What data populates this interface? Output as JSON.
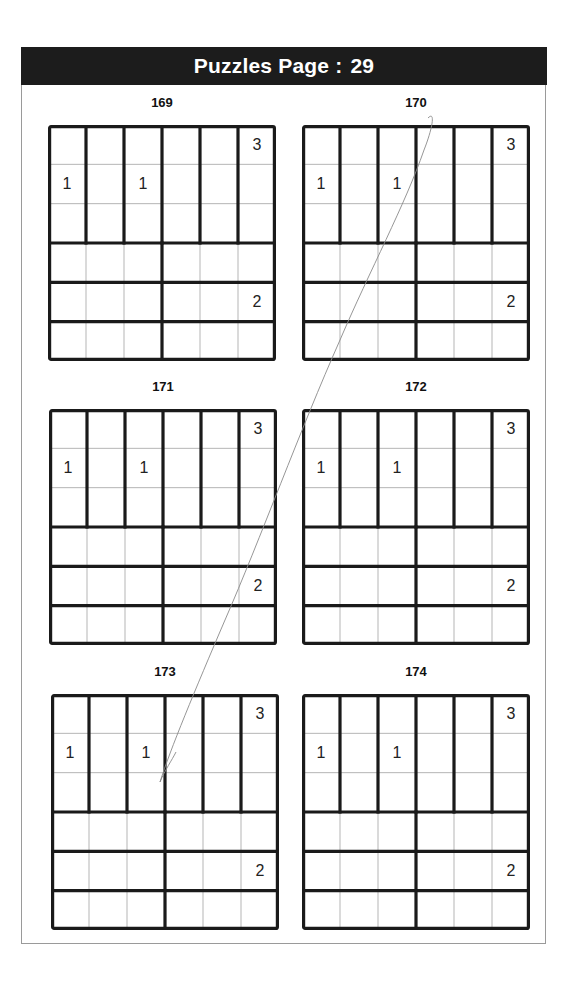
{
  "header": {
    "title": "Puzzles Page :",
    "page_number": "29"
  },
  "grid_size": 6,
  "puzzles": [
    {
      "id": "169",
      "clues": [
        {
          "row": 0,
          "col": 5,
          "value": "3"
        },
        {
          "row": 1,
          "col": 0,
          "value": "1"
        },
        {
          "row": 1,
          "col": 2,
          "value": "1"
        },
        {
          "row": 4,
          "col": 5,
          "value": "2"
        }
      ]
    },
    {
      "id": "170",
      "clues": [
        {
          "row": 0,
          "col": 5,
          "value": "3"
        },
        {
          "row": 1,
          "col": 0,
          "value": "1"
        },
        {
          "row": 1,
          "col": 2,
          "value": "1"
        },
        {
          "row": 4,
          "col": 5,
          "value": "2"
        }
      ]
    },
    {
      "id": "171",
      "clues": [
        {
          "row": 0,
          "col": 5,
          "value": "3"
        },
        {
          "row": 1,
          "col": 0,
          "value": "1"
        },
        {
          "row": 1,
          "col": 2,
          "value": "1"
        },
        {
          "row": 4,
          "col": 5,
          "value": "2"
        }
      ]
    },
    {
      "id": "172",
      "clues": [
        {
          "row": 0,
          "col": 5,
          "value": "3"
        },
        {
          "row": 1,
          "col": 0,
          "value": "1"
        },
        {
          "row": 1,
          "col": 2,
          "value": "1"
        },
        {
          "row": 4,
          "col": 5,
          "value": "2"
        }
      ]
    },
    {
      "id": "173",
      "clues": [
        {
          "row": 0,
          "col": 5,
          "value": "3"
        },
        {
          "row": 1,
          "col": 0,
          "value": "1"
        },
        {
          "row": 1,
          "col": 2,
          "value": "1"
        },
        {
          "row": 4,
          "col": 5,
          "value": "2"
        }
      ]
    },
    {
      "id": "174",
      "clues": [
        {
          "row": 0,
          "col": 5,
          "value": "3"
        },
        {
          "row": 1,
          "col": 0,
          "value": "1"
        },
        {
          "row": 1,
          "col": 2,
          "value": "1"
        },
        {
          "row": 4,
          "col": 5,
          "value": "2"
        }
      ]
    }
  ],
  "regions": {
    "top_half": "six vertical 1x3 regions in rows 0-2",
    "bottom_half": "horizontal 3x1 regions in rows 3-5, split at column 3"
  },
  "colors": {
    "header_bg": "#1c1c1c",
    "header_text": "#ffffff",
    "thick_line": "#1a1a1a",
    "thin_line": "#b5b5b5",
    "scribble": "#8a8a8a"
  }
}
